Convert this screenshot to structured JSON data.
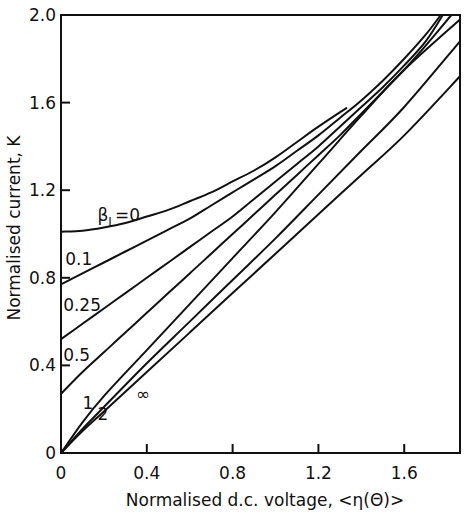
{
  "chart_data": {
    "type": "line",
    "title": "",
    "xlabel": "Normalised  d.c. voltage, <η(Θ)>",
    "ylabel": "Normalised  current, K",
    "xlim": [
      0,
      1.86
    ],
    "ylim": [
      0,
      2.0
    ],
    "xticks": [
      0,
      0.4,
      0.8,
      1.2,
      1.6
    ],
    "xtick_labels": [
      "0",
      "0.4",
      "0.8",
      "1.2",
      "1.6"
    ],
    "yticks": [
      0,
      0.4,
      0.8,
      1.2,
      1.6,
      2.0
    ],
    "ytick_labels": [
      "0",
      "0.4",
      "0.8",
      "1.2",
      "1.6",
      "2.0"
    ],
    "grid": false,
    "legend": "inline labels near curves",
    "parameter": "βL",
    "series": [
      {
        "name": "βL=0",
        "label": "βL=0",
        "x": [
          0,
          0.1,
          0.2,
          0.3,
          0.4,
          0.5,
          0.6,
          0.7,
          0.8,
          0.9,
          1.0,
          1.1,
          1.2,
          1.33
        ],
        "y": [
          1.01,
          1.015,
          1.03,
          1.05,
          1.08,
          1.11,
          1.15,
          1.19,
          1.24,
          1.29,
          1.35,
          1.42,
          1.49,
          1.575
        ]
      },
      {
        "name": "βL=0.1",
        "label": "0.1",
        "x": [
          0,
          0.1,
          0.2,
          0.3,
          0.4,
          0.5,
          0.6,
          0.7,
          0.8,
          0.9,
          1.0,
          1.1,
          1.2,
          1.3,
          1.4,
          1.5,
          1.6,
          1.7,
          1.77
        ],
        "y": [
          0.77,
          0.82,
          0.87,
          0.92,
          0.97,
          1.02,
          1.07,
          1.13,
          1.19,
          1.25,
          1.31,
          1.38,
          1.45,
          1.53,
          1.61,
          1.7,
          1.8,
          1.91,
          2.0
        ]
      },
      {
        "name": "βL=0.25",
        "label": "0.25",
        "x": [
          0,
          0.1,
          0.2,
          0.3,
          0.4,
          0.5,
          0.6,
          0.7,
          0.8,
          0.9,
          1.0,
          1.1,
          1.2,
          1.3,
          1.4,
          1.5,
          1.6,
          1.7,
          1.78
        ],
        "y": [
          0.52,
          0.59,
          0.66,
          0.73,
          0.8,
          0.87,
          0.94,
          1.01,
          1.08,
          1.16,
          1.24,
          1.32,
          1.4,
          1.49,
          1.58,
          1.67,
          1.77,
          1.88,
          2.0
        ]
      },
      {
        "name": "βL=0.5",
        "label": "0.5",
        "x": [
          0,
          0.1,
          0.2,
          0.3,
          0.4,
          0.5,
          0.6,
          0.7,
          0.8,
          0.9,
          1.0,
          1.1,
          1.2,
          1.3,
          1.4,
          1.5,
          1.6,
          1.7,
          1.82
        ],
        "y": [
          0.27,
          0.37,
          0.46,
          0.55,
          0.64,
          0.73,
          0.82,
          0.91,
          1.0,
          1.09,
          1.18,
          1.27,
          1.36,
          1.45,
          1.55,
          1.65,
          1.75,
          1.86,
          2.0
        ]
      },
      {
        "name": "βL=1",
        "label": "1",
        "x": [
          0,
          0.1,
          0.2,
          0.4,
          0.6,
          0.8,
          1.0,
          1.2,
          1.4,
          1.6,
          1.86
        ],
        "y": [
          0,
          0.14,
          0.26,
          0.47,
          0.68,
          0.89,
          1.1,
          1.32,
          1.54,
          1.75,
          1.98
        ]
      },
      {
        "name": "βL=2",
        "label": "2",
        "x": [
          0,
          0.1,
          0.2,
          0.4,
          0.6,
          0.8,
          1.0,
          1.2,
          1.4,
          1.6,
          1.86
        ],
        "y": [
          0,
          0.11,
          0.21,
          0.41,
          0.6,
          0.79,
          0.98,
          1.18,
          1.38,
          1.58,
          1.88
        ]
      },
      {
        "name": "βL=∞",
        "label": "∞",
        "x": [
          0,
          0.1,
          0.2,
          0.4,
          0.6,
          0.8,
          1.0,
          1.2,
          1.4,
          1.6,
          1.86
        ],
        "y": [
          0,
          0.1,
          0.19,
          0.37,
          0.55,
          0.73,
          0.91,
          1.09,
          1.27,
          1.45,
          1.72
        ]
      }
    ],
    "label_positions": [
      {
        "text": "β",
        "sub": "L",
        "suffix": "=0",
        "x": 0.17,
        "y": 1.06
      },
      {
        "text": "0.1",
        "x": 0.02,
        "y": 0.86
      },
      {
        "text": "0.25",
        "x": 0.01,
        "y": 0.65
      },
      {
        "text": "0.5",
        "x": 0.01,
        "y": 0.42
      },
      {
        "text": "1",
        "x": 0.1,
        "y": 0.2
      },
      {
        "text": "2",
        "x": 0.17,
        "y": 0.15
      },
      {
        "text": "∞",
        "x": 0.35,
        "y": 0.24
      }
    ]
  },
  "colors": {
    "line": "#111111",
    "background": "#ffffff"
  }
}
